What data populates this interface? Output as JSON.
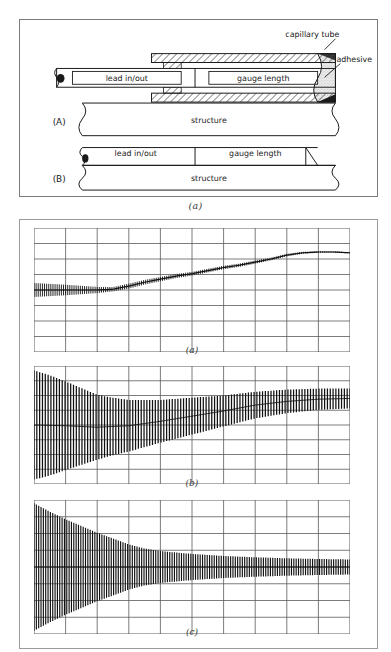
{
  "figure_top": {
    "caption": "(a)",
    "panels": [
      {
        "tag": "(A)",
        "labels": {
          "lead": "lead in/out",
          "gauge": "gauge length",
          "structure": "structure",
          "capillary": "capillary tube",
          "adhesive": "adhesive"
        }
      },
      {
        "tag": "(B)",
        "labels": {
          "lead": "lead in/out",
          "gauge": "gauge length",
          "structure": "structure"
        }
      }
    ]
  },
  "figure_charts": {
    "captions": {
      "a": "(a)",
      "b": "(b)",
      "c": "(c)"
    }
  },
  "colors": {
    "ink": "#1a1a1a",
    "frame": "#7b7b7b",
    "grid": "#5a5a5a",
    "trace": "#111111",
    "paper": "#ffffff"
  },
  "chart_data": [
    {
      "type": "line",
      "title": "(a)",
      "xlabel": "",
      "ylabel": "",
      "grid": true,
      "grid_cols": 10,
      "grid_rows": 8,
      "xlim": [
        0,
        10
      ],
      "ylim": [
        0,
        8
      ],
      "legend": "none",
      "description": "Strip-chart trace: flat noisy baseline with small ripple, then a steady monotonic rise in steps, levelling off near the right.",
      "series": [
        {
          "name": "mean-trend",
          "x": [
            0.0,
            0.5,
            1.0,
            1.5,
            2.0,
            2.5,
            3.0,
            3.5,
            4.0,
            4.5,
            5.0,
            5.5,
            6.0,
            6.5,
            7.0,
            7.5,
            8.0,
            8.5,
            9.0,
            9.5,
            10.0
          ],
          "values": [
            4.0,
            4.0,
            4.0,
            4.0,
            4.0,
            4.05,
            4.25,
            4.5,
            4.7,
            4.9,
            5.05,
            5.25,
            5.45,
            5.6,
            5.8,
            6.0,
            6.25,
            6.4,
            6.45,
            6.45,
            6.4
          ]
        },
        {
          "name": "ripple-amplitude",
          "x": [
            0.0,
            1.0,
            2.0,
            2.5,
            3.0,
            4.0,
            5.0,
            6.0,
            7.0,
            8.0,
            9.0,
            10.0
          ],
          "values": [
            0.45,
            0.34,
            0.2,
            0.14,
            0.16,
            0.14,
            0.12,
            0.11,
            0.1,
            0.08,
            0.05,
            0.04
          ]
        }
      ]
    },
    {
      "type": "line",
      "title": "(b)",
      "xlabel": "",
      "ylabel": "",
      "grid": true,
      "grid_cols": 10,
      "grid_rows": 8,
      "xlim": [
        0,
        10
      ],
      "ylim": [
        0,
        8
      ],
      "legend": "none",
      "description": "Oscillatory trace with large initial amplitude decaying toward the right while the mean level rises; dense vertical strokes of a pen recorder.",
      "series": [
        {
          "name": "mean-trend",
          "x": [
            0.0,
            1.0,
            2.0,
            3.0,
            4.0,
            5.0,
            6.0,
            7.0,
            8.0,
            9.0,
            10.0
          ],
          "values": [
            4.0,
            3.95,
            3.85,
            3.95,
            4.25,
            4.6,
            4.95,
            5.35,
            5.6,
            5.75,
            5.8
          ]
        },
        {
          "name": "oscillation-amplitude",
          "x": [
            0.0,
            0.5,
            1.0,
            1.5,
            2.0,
            2.5,
            3.0,
            3.5,
            4.0,
            5.0,
            6.0,
            7.0,
            8.0,
            9.0,
            10.0
          ],
          "values": [
            3.7,
            3.4,
            3.0,
            2.6,
            2.2,
            1.95,
            1.75,
            1.6,
            1.45,
            1.25,
            1.05,
            0.9,
            0.8,
            0.72,
            0.68
          ]
        }
      ]
    },
    {
      "type": "line",
      "title": "(c)",
      "xlabel": "",
      "ylabel": "",
      "grid": true,
      "grid_cols": 10,
      "grid_rows": 8,
      "xlim": [
        0,
        10
      ],
      "ylim": [
        0,
        8
      ],
      "legend": "none",
      "description": "Strongly damped oscillation about an essentially constant mean: very large amplitude at the left decaying rapidly to a narrow band of ripple at the right.",
      "series": [
        {
          "name": "mean-trend",
          "x": [
            0.0,
            1.0,
            2.0,
            3.0,
            4.0,
            5.0,
            6.0,
            7.0,
            8.0,
            9.0,
            10.0
          ],
          "values": [
            4.0,
            4.0,
            4.0,
            4.0,
            4.0,
            4.0,
            4.0,
            4.0,
            4.0,
            4.0,
            4.0
          ]
        },
        {
          "name": "oscillation-amplitude",
          "x": [
            0.0,
            0.5,
            1.0,
            1.5,
            2.0,
            2.5,
            3.0,
            3.5,
            4.0,
            5.0,
            6.0,
            7.0,
            8.0,
            9.0,
            10.0
          ],
          "values": [
            3.8,
            3.3,
            2.85,
            2.45,
            2.05,
            1.7,
            1.35,
            1.1,
            0.95,
            0.78,
            0.66,
            0.58,
            0.52,
            0.48,
            0.45
          ]
        }
      ]
    }
  ]
}
